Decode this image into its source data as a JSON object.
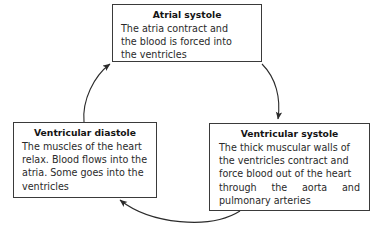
{
  "diagram": {
    "stroke_color": "#3a3a3a",
    "text_color": "#2a2a2a",
    "background": "#ffffff",
    "nodes": [
      {
        "id": "atrial-systole",
        "heading": "Atrial systole",
        "line1": "The atria contract and",
        "line2": "the blood is forced into",
        "line3": "the ventricles"
      },
      {
        "id": "ventricular-diastole",
        "heading": "Ventricular diastole",
        "line1": "The muscles of the heart",
        "line2": "relax. Blood flows into the",
        "line3": "atria. Some goes into the",
        "line4": "ventricles"
      },
      {
        "id": "ventricular-systole",
        "heading": "Ventricular systole",
        "line1": "The thick muscular walls of",
        "line2": "the ventricles contract and",
        "line3": "force blood out of the heart",
        "line4": "through the aorta and",
        "line5": "pulmonary arteries"
      }
    ],
    "arrows": [
      {
        "id": "arrow-diastole-to-atrial",
        "from": "ventricular-diastole",
        "to": "atrial-systole"
      },
      {
        "id": "arrow-atrial-to-systole",
        "from": "atrial-systole",
        "to": "ventricular-systole"
      },
      {
        "id": "arrow-systole-to-diastole",
        "from": "ventricular-systole",
        "to": "ventricular-diastole"
      }
    ]
  }
}
